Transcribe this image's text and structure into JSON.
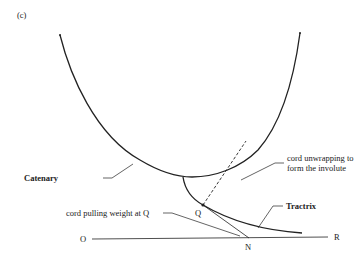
{
  "figure": {
    "panel_label": "(c)",
    "labels": {
      "catenary": "Catenary",
      "tractrix": "Tractrix",
      "involute_line1": "cord unwrapping to",
      "involute_line2": "form the involute",
      "cord_pulling": "cord pulling weight at Q",
      "point_q": "Q",
      "point_o": "O",
      "point_r": "R",
      "point_n": "N"
    },
    "colors": {
      "ink": "#222222",
      "background": "#ffffff"
    }
  }
}
